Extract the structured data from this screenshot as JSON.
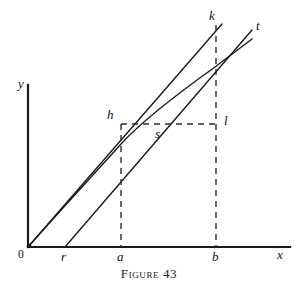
{
  "figure": {
    "caption": "Figure 43",
    "axes": {
      "x_label": "x",
      "y_label": "y",
      "origin_label": "0",
      "x_axis": {
        "x_start": 28,
        "x_end": 290,
        "y": 247
      },
      "y_axis": {
        "x": 28,
        "y_start": 85,
        "y_end": 247
      }
    },
    "x_ticks": [
      {
        "label": "r",
        "x": 65
      },
      {
        "label": "a",
        "x": 121
      },
      {
        "label": "b",
        "x": 216
      }
    ],
    "point_labels": [
      {
        "label": "h",
        "x": 121,
        "y": 124
      },
      {
        "label": "s",
        "x": 152,
        "y": 129
      },
      {
        "label": "l",
        "x": 216,
        "y": 124
      },
      {
        "label": "k",
        "x": 222,
        "y": 24
      },
      {
        "label": "t",
        "x": 252,
        "y": 30
      }
    ],
    "curves": [
      {
        "name": "line-k-secant",
        "description": "straight line from origin through h to k",
        "points": [
          [
            28,
            247
          ],
          [
            222,
            24
          ]
        ]
      },
      {
        "name": "curve-through-h-s",
        "description": "concave curve from origin rising through h and s up to t",
        "points": [
          [
            28,
            247
          ],
          [
            60,
            211
          ],
          [
            92,
            175
          ],
          [
            121,
            144
          ],
          [
            152,
            122
          ],
          [
            186,
            98
          ],
          [
            215,
            77
          ],
          [
            252,
            50
          ]
        ]
      },
      {
        "name": "line-r-tangent",
        "description": "straight line from r on the x-axis through s to t",
        "points": [
          [
            65,
            247
          ],
          [
            252,
            30
          ]
        ]
      }
    ],
    "dashed_guides": [
      {
        "name": "horizontal-h-to-l",
        "points": [
          [
            121,
            124
          ],
          [
            216,
            124
          ]
        ]
      },
      {
        "name": "vertical-a-to-h",
        "points": [
          [
            121,
            124
          ],
          [
            121,
            247
          ]
        ]
      },
      {
        "name": "vertical-b-to-k",
        "points": [
          [
            216,
            25
          ],
          [
            216,
            247
          ]
        ]
      }
    ]
  }
}
